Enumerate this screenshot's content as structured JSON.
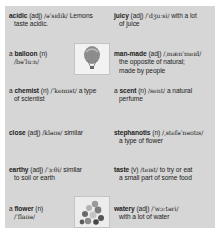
{
  "panel": {
    "background": "#d6d6d6"
  },
  "left_column": [
    {
      "article": "",
      "headword": "acidic",
      "pos": "(adj)",
      "ipa": "/əˈsɪdɪk/",
      "definition_line1": "Lemons",
      "definition_line2": "taste acidic."
    },
    {
      "article": "a",
      "headword": "balloon",
      "pos": "(n)",
      "ipa": "/bəˈluːn/",
      "definition_line1": "",
      "definition_line2": "",
      "image": "hot-air-balloon-illustration"
    },
    {
      "article": "a",
      "headword": "chemist",
      "pos": "(n)",
      "ipa": "/ˈkemɪst/",
      "definition_line1": "a type",
      "definition_line2": "of scientist"
    },
    {
      "article": "",
      "headword": "close",
      "pos": "(adj)",
      "ipa": "/kləʊs/",
      "definition_line1": "similar",
      "definition_line2": ""
    },
    {
      "article": "",
      "headword": "earthy",
      "pos": "(adj)",
      "ipa": "/ˈɜːθi/",
      "definition_line1": "similar",
      "definition_line2": "to soil or earth"
    },
    {
      "article": "a",
      "headword": "flower",
      "pos": "(n)",
      "ipa": "/ˈflaʊə/",
      "definition_line1": "",
      "definition_line2": "",
      "image": "flower-bouquet-illustration"
    }
  ],
  "right_column": [
    {
      "article": "",
      "headword": "juicy",
      "pos": "(adj)",
      "ipa": "/ˈdʒuːsi/",
      "definition_line1": "with a lot",
      "definition_line2": "of juice"
    },
    {
      "article": "",
      "headword": "man-made",
      "pos": "(adj)",
      "ipa": "/ˌmænˈmeɪd/",
      "definition_line1": "",
      "definition_line2": "the opposite of natural;",
      "definition_line3": "made by people"
    },
    {
      "article": "a",
      "headword": "scent",
      "pos": "(n)",
      "ipa": "/sent/",
      "definition_line1": "a natural",
      "definition_line2": "perfume"
    },
    {
      "article": "",
      "headword": "stephanotis",
      "pos": "(n)",
      "ipa": "/ˌstefəˈnəʊtɪs/",
      "definition_line1": "",
      "definition_line2": "a type of flower"
    },
    {
      "article": "",
      "headword": "taste",
      "pos": "(v)",
      "ipa": "/teɪst/",
      "definition_line1": "to try or eat",
      "definition_line2": "a small part of some food"
    },
    {
      "article": "",
      "headword": "watery",
      "pos": "(adj)",
      "ipa": "/ˈwɔːtəri/",
      "definition_line1": "",
      "definition_line2": "with a lot of water"
    }
  ]
}
